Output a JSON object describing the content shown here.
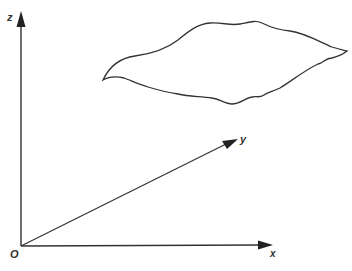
{
  "diagram": {
    "type": "3d-coordinate-axes",
    "colors": {
      "line": "#333333",
      "background": "#ffffff"
    },
    "origin": {
      "label": "O"
    },
    "axes": [
      {
        "name": "x",
        "label": "x"
      },
      {
        "name": "y",
        "label": "y"
      },
      {
        "name": "z",
        "label": "z"
      }
    ],
    "region": {
      "shape": "closed-wavy-surface"
    }
  }
}
